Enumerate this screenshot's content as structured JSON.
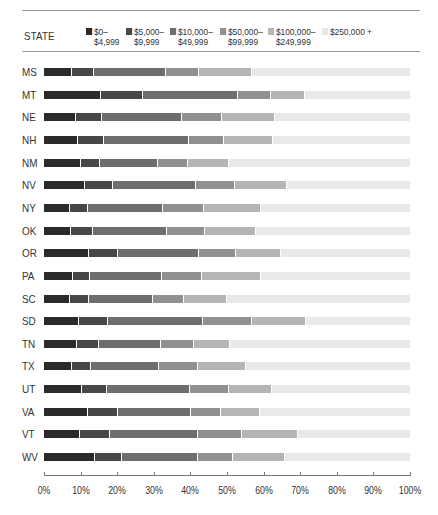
{
  "header": {
    "state_label": "STATE"
  },
  "legend": [
    {
      "line1": "$0–",
      "line2": "$4,999",
      "color": "#2b2b2b",
      "x": 0
    },
    {
      "line1": "$5,000–",
      "line2": "$9,999",
      "color": "#474747",
      "x": 40
    },
    {
      "line1": "$10,000–",
      "line2": "$49,999",
      "color": "#6e6e6e",
      "x": 84
    },
    {
      "line1": "$50,000–",
      "line2": "$99,999",
      "color": "#909090",
      "x": 134
    },
    {
      "line1": "$100,000–",
      "line2": "$249,999",
      "color": "#b5b5b5",
      "x": 182
    },
    {
      "line1": "$250,000 +",
      "line2": "",
      "color": "#e9e9e9",
      "x": 236
    }
  ],
  "chart_data": {
    "type": "bar",
    "orientation": "horizontal",
    "stacked": true,
    "title": "",
    "xlabel": "",
    "ylabel": "STATE",
    "xlim": [
      0,
      100
    ],
    "x_ticks": [
      "0%",
      "10%",
      "20%",
      "30%",
      "40%",
      "50%",
      "60%",
      "70%",
      "80%",
      "90%",
      "100%"
    ],
    "legend_position": "top",
    "grid": false,
    "categories": [
      "MS",
      "MT",
      "NE",
      "NH",
      "NM",
      "NV",
      "NY",
      "OK",
      "OR",
      "PA",
      "SC",
      "SD",
      "TN",
      "TX",
      "UT",
      "VA",
      "VT",
      "WV"
    ],
    "series": [
      {
        "name": "$0–$4,999",
        "color": "#2b2b2b",
        "values": [
          7.7,
          15.6,
          8.7,
          9.3,
          10.1,
          11.2,
          7.1,
          7.4,
          12.3,
          7.9,
          7.1,
          9.6,
          9.0,
          7.7,
          10.4,
          12.0,
          9.8,
          13.9
        ]
      },
      {
        "name": "$5,000–$9,999",
        "color": "#474747",
        "values": [
          6.0,
          11.4,
          7.1,
          7.1,
          5.2,
          7.7,
          4.9,
          6.0,
          7.9,
          4.7,
          5.2,
          7.9,
          6.0,
          5.1,
          6.8,
          8.2,
          8.2,
          7.4
        ]
      },
      {
        "name": "$10,000–$49,999",
        "color": "#6e6e6e",
        "values": [
          19.6,
          26.0,
          21.9,
          23.2,
          15.8,
          22.6,
          20.5,
          20.2,
          22.1,
          19.6,
          17.5,
          25.9,
          17.0,
          18.6,
          22.7,
          20.0,
          24.0,
          20.8
        ]
      },
      {
        "name": "$50,000–$99,999",
        "color": "#909090",
        "values": [
          9.0,
          9.0,
          10.9,
          9.6,
          8.2,
          10.7,
          11.2,
          10.4,
          10.2,
          11.0,
          8.5,
          13.4,
          9.0,
          10.7,
          10.6,
          8.2,
          12.1,
          9.5
        ]
      },
      {
        "name": "$100,000–$249,999",
        "color": "#b5b5b5",
        "values": [
          14.5,
          9.3,
          14.4,
          13.4,
          11.2,
          14.2,
          15.6,
          13.9,
          12.3,
          16.1,
          11.7,
          14.8,
          9.8,
          13.1,
          11.8,
          10.6,
          15.3,
          14.2
        ]
      },
      {
        "name": "$250,000 +",
        "color": "#e9e9e9",
        "values": [
          43.2,
          28.7,
          37.0,
          37.4,
          49.5,
          33.6,
          40.7,
          42.1,
          35.2,
          40.7,
          50.0,
          28.4,
          49.2,
          44.8,
          37.7,
          41.0,
          30.6,
          34.2
        ]
      }
    ]
  }
}
